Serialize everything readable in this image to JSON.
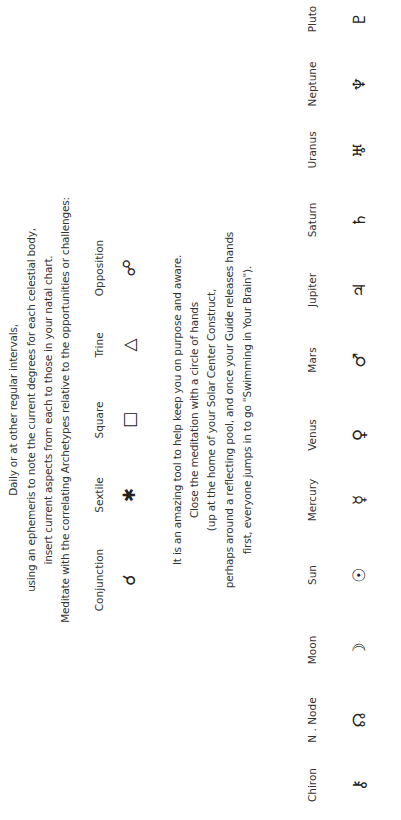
{
  "intro_lines": [
    "Daily or at other regular intervals,",
    "using an ephemeris to note the current degrees for each celestial body,",
    "insert current aspects from each to those in your natal chart.",
    "Meditate with the correlating Archetypes relative to the opportunities or challenges:"
  ],
  "aspects": [
    {
      "label": "Conjunction",
      "glyph": "☌"
    },
    {
      "label": "Sextile",
      "glyph": "✱"
    },
    {
      "label": "Square",
      "glyph": "□"
    },
    {
      "label": "Trine",
      "glyph": "△"
    },
    {
      "label": "Opposition",
      "glyph": "☍"
    }
  ],
  "closing_lines": [
    "It is an amazing tool to help keep you on purpose and aware.",
    "Close the meditation with a circle of hands",
    "(up at the home of your  Solar  Center  Construct,",
    "perhaps around a reflecting pool, and once your Guide  releases hands",
    "first, everyone jumps in to go \"Swimming in Your  Brain\")."
  ],
  "bodies": [
    {
      "label": "Chiron",
      "glyph": "⚷"
    },
    {
      "label": "N . Node",
      "glyph": "☊"
    },
    {
      "label": "Moon",
      "glyph": "☽"
    },
    {
      "label": "Sun",
      "glyph": "☉"
    },
    {
      "label": "Mercury",
      "glyph": "☿"
    },
    {
      "label": "Venus",
      "glyph": "♀"
    },
    {
      "label": "Mars",
      "glyph": "♂"
    },
    {
      "label": "Jupiter",
      "glyph": "♃"
    },
    {
      "label": "Saturn",
      "glyph": "♄"
    },
    {
      "label": "Uranus",
      "glyph": "♅"
    },
    {
      "label": "Neptune",
      "glyph": "♆"
    },
    {
      "label": "Pluto",
      "glyph": "♇"
    }
  ]
}
